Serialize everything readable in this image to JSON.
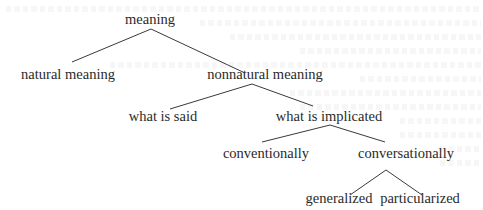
{
  "diagram": {
    "type": "tree",
    "nodes": {
      "root": "meaning",
      "natural": "natural meaning",
      "nonnatural": "nonnatural meaning",
      "said": "what is said",
      "implicated": "what is implicated",
      "conventional": "conventionally",
      "conversational": "conversationally",
      "generalized": "generalized",
      "particularized": "particularized"
    },
    "edges": [
      [
        "meaning",
        "natural meaning"
      ],
      [
        "meaning",
        "nonnatural meaning"
      ],
      [
        "nonnatural meaning",
        "what is said"
      ],
      [
        "nonnatural meaning",
        "what is implicated"
      ],
      [
        "what is implicated",
        "conventionally"
      ],
      [
        "what is implicated",
        "conversationally"
      ],
      [
        "conversationally",
        "generalized"
      ],
      [
        "conversationally",
        "particularized"
      ]
    ]
  }
}
